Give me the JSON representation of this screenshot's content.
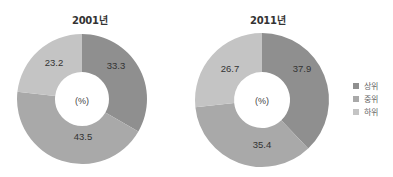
{
  "colors": {
    "upper": "#8f8f8f",
    "middle": "#a9a9a9",
    "lower": "#c4c4c4"
  },
  "charts": [
    {
      "title": "2001년",
      "center_label": "(%)",
      "labels": [
        "33.3",
        "43.5",
        "23.2"
      ]
    },
    {
      "title": "2011년",
      "center_label": "(%)",
      "labels": [
        "37.9",
        "35.4",
        "26.7"
      ]
    }
  ],
  "legend": {
    "items": [
      {
        "label": "상위",
        "color": "#8f8f8f"
      },
      {
        "label": "중위",
        "color": "#a9a9a9"
      },
      {
        "label": "하위",
        "color": "#c4c4c4"
      }
    ]
  },
  "chart_data": [
    {
      "type": "pie",
      "title": "2001년",
      "categories": [
        "상위",
        "중위",
        "하위"
      ],
      "values": [
        33.3,
        43.5,
        23.2
      ],
      "unit": "%",
      "donut": true,
      "legend_position": "right"
    },
    {
      "type": "pie",
      "title": "2011년",
      "categories": [
        "상위",
        "중위",
        "하위"
      ],
      "values": [
        37.9,
        35.4,
        26.7
      ],
      "unit": "%",
      "donut": true,
      "legend_position": "right"
    }
  ]
}
